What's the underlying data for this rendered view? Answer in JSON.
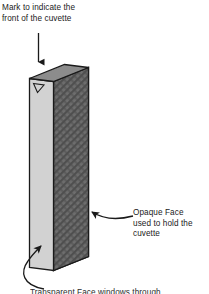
{
  "figure": {
    "background_color": "#ffffff",
    "annotations": {
      "top_label": "Mark to indicate the\nfront of the cuvette",
      "right_label": "Opaque Face\nused to hold the\ncuvette",
      "bottom_label": "Transparent Face windows through"
    },
    "object": {
      "name": "cuvette",
      "faces": [
        {
          "name": "top-face",
          "fill": "#8c8c8c",
          "stroke": "#1a1a1a"
        },
        {
          "name": "front-face-clear",
          "fill": "#d2d2d2",
          "stroke": "#1a1a1a"
        },
        {
          "name": "side-face-opaque",
          "fill": "#6e6e6e",
          "stroke": "#1a1a1a",
          "pattern": "diagonal-cross-hatch"
        }
      ],
      "mark": {
        "name": "front-indicator-triangle",
        "fill": "#d2d2d2",
        "stroke": "#1a1a1a"
      }
    },
    "arrows": [
      {
        "name": "arrow-down-to-mark",
        "style": "straight",
        "color": "#1a1a1a"
      },
      {
        "name": "arrow-curved-to-opaque-face",
        "style": "curved",
        "color": "#1a1a1a"
      },
      {
        "name": "arrow-curved-to-clear-face",
        "style": "curved",
        "color": "#1a1a1a"
      }
    ],
    "colors": {
      "line": "#1a1a1a",
      "light_face": "#d2d2d2",
      "top_face": "#8c8c8c",
      "opaque_face": "#6e6e6e",
      "hatch": "#4a4a4a",
      "text": "#1a1a1a"
    }
  }
}
